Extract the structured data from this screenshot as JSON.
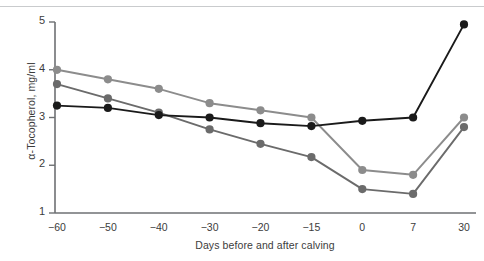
{
  "chart_data": {
    "type": "line",
    "title": "",
    "subtitle": "",
    "xlabel": "Days before and after calving",
    "ylabel": "α-Tocopherol, mg/ml",
    "x": [
      -60,
      -50,
      -40,
      -30,
      -20,
      -15,
      0,
      7,
      30
    ],
    "xtick_labels": [
      "−60",
      "−50",
      "−40",
      "−30",
      "−20",
      "−15",
      "0",
      "7",
      "30"
    ],
    "ytick_labels": [
      "1",
      "2",
      "3",
      "4",
      "5"
    ],
    "yticks": [
      1,
      2,
      3,
      4,
      5
    ],
    "ylim": [
      1,
      5
    ],
    "grid": false,
    "legend": "none",
    "series": [
      {
        "name": "light-gray-series",
        "color": "#8c8c8c",
        "marker": "circle",
        "values": [
          4.0,
          3.8,
          3.6,
          3.3,
          3.15,
          3.0,
          1.9,
          1.8,
          3.0
        ]
      },
      {
        "name": "dark-gray-series",
        "color": "#6b6b6b",
        "marker": "circle",
        "values": [
          3.7,
          3.4,
          3.1,
          2.75,
          2.45,
          2.17,
          1.5,
          1.4,
          2.8
        ]
      },
      {
        "name": "black-series",
        "color": "#1a1a1a",
        "marker": "circle",
        "values": [
          3.25,
          3.2,
          3.05,
          3.0,
          2.88,
          2.82,
          2.93,
          3.0,
          4.95
        ]
      }
    ]
  },
  "axis": {
    "line_color": "#6e7073",
    "tick_color": "#6e7073"
  },
  "decor": {
    "top_rule_color": "#c9cbcd"
  }
}
